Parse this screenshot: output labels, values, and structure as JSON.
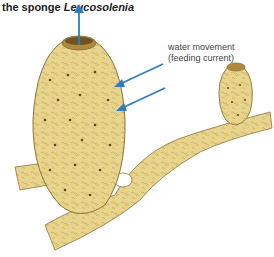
{
  "title": {
    "prefix": "the sponge ",
    "genus": "Leucosolenia"
  },
  "annotation": {
    "line1": "water movement",
    "line2": "(feeding current)"
  },
  "colors": {
    "sponge_fill": "#e8d48a",
    "sponge_outline": "#8a7440",
    "arrow": "#2f7ec4",
    "pore": "#5a4a20",
    "osculum_inner": "#b08a3a"
  },
  "arrows": [
    {
      "name": "exhalant-flow",
      "direction": "up"
    },
    {
      "name": "inhalant-flow-1",
      "direction": "into-body"
    },
    {
      "name": "inhalant-flow-2",
      "direction": "into-body"
    }
  ]
}
